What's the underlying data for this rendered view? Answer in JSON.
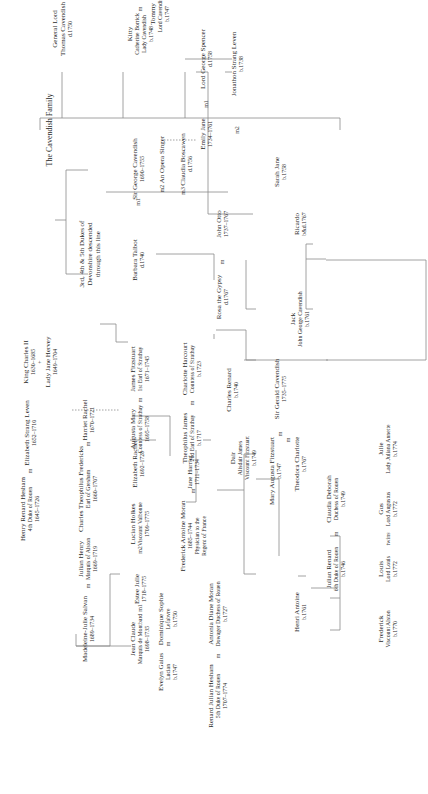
{
  "title": "The Cavendish Family",
  "marks": {
    "m": "m",
    "m1": "m1",
    "m2": "m2",
    "m3": "m3",
    "plus": "+",
    "twins": "twins"
  },
  "people": {
    "general_lord": {
      "name": "General Lord",
      "sub": "Thomas Cavendish",
      "dates": "d.1750"
    },
    "kitty": {
      "name": "Kitty",
      "sub": "Catherine Borrick",
      "sub2": "Lady Cavendish",
      "dates": "b.1748"
    },
    "tommy": {
      "name": "Tommy",
      "sub": "Lord Cavendish",
      "dates": "b.1747"
    },
    "emily_jane": {
      "name": "Emily Jane",
      "dates": "1734–1761"
    },
    "lord_george_spencer": {
      "name": "Lord George Spencer",
      "dates": "d.1758"
    },
    "jonathon_strang_leven": {
      "name": "Jonathon Strang Leven",
      "dates": "b.1738"
    },
    "sarah_jane": {
      "name": "Sarah Jane",
      "dates": "b.1758"
    },
    "dukes_devonshire": {
      "name": "3rd, 4th & 5th Dukes of",
      "sub": "Devonshire descended",
      "sub2": "through this line"
    },
    "sir_george_cavendish": {
      "name": "Sir George Cavendish",
      "dates": "1690–1755"
    },
    "opera_singer": {
      "name": "An Opera Singer"
    },
    "claudia_boscawen": {
      "name": "Claudia Boscawen",
      "dates": "d.1756"
    },
    "barbara_talbot": {
      "name": "Barbara Talbot",
      "dates": "d.1740"
    },
    "rosa_gypsy": {
      "name": "Rosa the Gypsy",
      "dates": "d.1767"
    },
    "john_otto": {
      "name": "John Otto",
      "dates": "1737–1767"
    },
    "jack": {
      "name": "Jack",
      "sub": "John George Cavendish",
      "dates": "b.1761"
    },
    "ricardo": {
      "name": "Ricardo",
      "dates": "b&d.1767"
    },
    "king_charles": {
      "name": "King Charles II",
      "dates": "1630–1685"
    },
    "lady_jane_hervey": {
      "name": "Lady Jane Hervey",
      "dates": "1649–1704"
    },
    "james_fitzstuart": {
      "name": "James Fitzstuart",
      "sub": "1st Earl of Strathay",
      "dates": "1671–1745"
    },
    "augusta_mary": {
      "name": "Augusta Mary",
      "sub": "Countess of Strathay",
      "dates": "1695–1758"
    },
    "theophilus_james": {
      "name": "Theophilus James",
      "sub": "2nd Earl of Strathay",
      "dates": "b.1717"
    },
    "charlotte_harcourt": {
      "name": "Charlotte Harcourt",
      "sub": "Countess of Strathay",
      "dates": "b.1723"
    },
    "charles_renard": {
      "name": "Charles Renard",
      "dates": "b.1740"
    },
    "dair": {
      "name": "Dair",
      "sub": "Alisdair James",
      "sub2": "Viscount Fitzstuart",
      "dates": "b.1749"
    },
    "sir_gerald_cavendish": {
      "name": "Sir Gerald Cavendish",
      "dates": "1735–1775"
    },
    "theodora_charlotte": {
      "name": "Theodora Charlotte",
      "dates": "b.1767"
    },
    "mary_augusta_fitzstuart": {
      "name": "Mary Augusta Fitzstuart",
      "dates": "b.1747"
    },
    "henry_renard_hesham": {
      "name": "Henry Renard Hesham",
      "sub": "4th Duke of Rouen",
      "dates": "1645–1726"
    },
    "elizabeth_strang_leven": {
      "name": "Elizabeth Strang Leven",
      "dates": "1652–1710"
    },
    "charles_theophilus": {
      "name": "Charles Theophilus Fredericks",
      "sub": "Earl of Gresham",
      "dates": "1660–1707"
    },
    "harriet_rachel": {
      "name": "Harriet Rachel",
      "dates": "1670–1721"
    },
    "elizabeth_rachel": {
      "name": "Elizabeth Rachel",
      "dates": "1692–1728"
    },
    "julian_henry": {
      "name": "Julian Henry",
      "sub": "Marquis of Alston",
      "dates": "1669–1719"
    },
    "lucian_holkes": {
      "name": "Lucian Holkes",
      "sub": "Viscount Valbonne",
      "dates": "1709–1775"
    },
    "estee_julie": {
      "name": "Estee Julie",
      "dates": "1718–1775"
    },
    "madeleine": {
      "name": "Madeleine-Julie Salvan",
      "dates": "1689–1734"
    },
    "jean_claude": {
      "name": "Jean Claude",
      "sub": "Marquis de Montbard",
      "dates": "1698–1735"
    },
    "frederick_antoine": {
      "name": "Frederick Antoine Moran",
      "sub": "1685–1744",
      "sub2": "Physician to the",
      "dates": "Regent of France"
    },
    "jane_harriet": {
      "name": "Jane Harriet",
      "dates": "1711–1734"
    },
    "antonia_diane": {
      "name": "Antonia Diane Moran",
      "sub": "Dowager Duchess of Rouen",
      "dates": "b.1727"
    },
    "evelyn_gaius": {
      "name": "Evelyn Gaius",
      "sub": "Lucian",
      "dates": "b.1747"
    },
    "dominique_sophie": {
      "name": "Dominique Sophie",
      "sub": "Lefabvre",
      "dates": "b.1750"
    },
    "renard_julian": {
      "name": "Renard Julian Hesham",
      "sub": "5th Duke of Rouen",
      "dates": "1707–1774"
    },
    "henri_antoine": {
      "name": "Henri Antoine",
      "dates": "b.1761"
    },
    "julian_renard": {
      "name": "Julian Renard",
      "sub": "6th Duke of Rouen",
      "dates": "b.1746"
    },
    "claudia_deborah": {
      "name": "Claudia Deborah",
      "sub": "Duchess of Rouen",
      "dates": "b.1749"
    },
    "frederick": {
      "name": "Frederick",
      "sub": "Viscount Alston",
      "dates": "b.1770"
    },
    "louis": {
      "name": "Louis",
      "sub": "Lord Louis",
      "dates": "b.1772"
    },
    "gus": {
      "name": "Gus",
      "sub": "Lord Augustus",
      "dates": "b.1772"
    },
    "julie": {
      "name": "Julie",
      "sub": "Lady Juliana Annette",
      "dates": "b.1774"
    }
  }
}
